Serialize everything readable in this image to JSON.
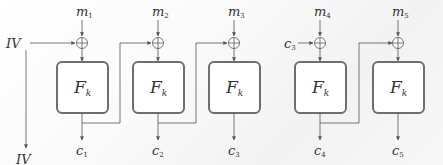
{
  "diagram": {
    "block_label": "F",
    "block_subscript": "k",
    "iv_label": "IV",
    "iv_output_label": "IV",
    "colors": {
      "stroke": "#555555",
      "box_stroke": "#6e6e6e",
      "text": "#333333"
    },
    "stages": [
      {
        "id": 1,
        "input": "m",
        "input_sub": "1",
        "output": "c",
        "output_sub": "1",
        "chain_from": "IV"
      },
      {
        "id": 2,
        "input": "m",
        "input_sub": "2",
        "output": "c",
        "output_sub": "2",
        "chain_from": "c1"
      },
      {
        "id": 3,
        "input": "m",
        "input_sub": "3",
        "output": "c",
        "output_sub": "3",
        "chain_from": "c2"
      },
      {
        "id": 4,
        "input": "m",
        "input_sub": "4",
        "output": "c",
        "output_sub": "4",
        "chain_from": "c3",
        "chain_label": "c",
        "chain_label_sub": "3"
      },
      {
        "id": 5,
        "input": "m",
        "input_sub": "5",
        "output": "c",
        "output_sub": "5",
        "chain_from": "c4"
      }
    ]
  }
}
